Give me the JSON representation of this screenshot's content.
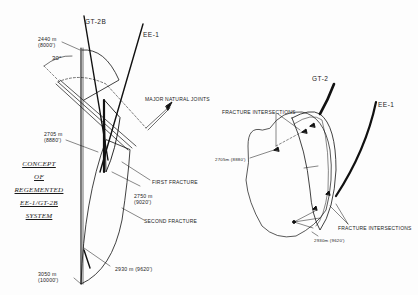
{
  "title": {
    "lines": [
      "CONCEPT",
      "OF",
      "REGEMENTED",
      "EE-1/GT-2B",
      "SYSTEM"
    ]
  },
  "left_diagram": {
    "wells": {
      "gt2b": "GT-2B",
      "ee1": "EE-1"
    },
    "angle": "30°",
    "depths": [
      {
        "m": "2440 m",
        "ft": "(8000')"
      },
      {
        "m": "2705 m",
        "ft": "(8880')"
      },
      {
        "m": "2750 m",
        "ft": "(9020')"
      },
      {
        "m": "2930 m (9620')"
      },
      {
        "m": "3050 m",
        "ft": "(10000')"
      }
    ],
    "callouts": {
      "joints": "MAJOR NATURAL JOINTS",
      "first": "FIRST FRACTURE",
      "second": "SECOND FRACTURE"
    }
  },
  "right_diagram": {
    "wells": {
      "gt2": "GT-2",
      "ee1": "EE-1"
    },
    "callouts": {
      "top": "FRACTURE INTERSECTIONS",
      "bottom": "FRACTURE INTERSECTIONS",
      "depth_top": "2705m (8880')",
      "depth_bottom": "2930m (9620')"
    }
  }
}
